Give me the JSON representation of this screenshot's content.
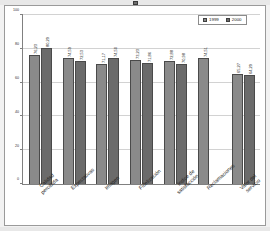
{
  "chart_data": {
    "type": "bar",
    "title": "",
    "subtitle": "",
    "xlabel": "",
    "ylabel": "",
    "ylim": [
      0,
      100
    ],
    "yticks": [
      0,
      20,
      40,
      60,
      80,
      100
    ],
    "ytick_labels": [
      "0",
      "20",
      "40",
      "60",
      "80",
      "100"
    ],
    "grid": true,
    "legend_position": "top-right",
    "categories": [
      "Calidad percibida",
      "Expectativas",
      "Imagen",
      "Fidelización",
      "Índice de satisfacción",
      "Reclamaciones",
      "Valor del servicio"
    ],
    "category_lines": [
      [
        "Calidad",
        "percibida"
      ],
      [
        "Expectativas"
      ],
      [
        "Imagen"
      ],
      [
        "Fidelización"
      ],
      [
        "Índice de",
        "satisfacción"
      ],
      [
        "Reclamaciones"
      ],
      [
        "Valor del",
        "servicio"
      ]
    ],
    "series": [
      {
        "name": "1999",
        "color": "#8a8a8a",
        "values": [
          76.23,
          74.59,
          71.17,
          73.23,
          72.88,
          74.51,
          65.27
        ],
        "labels": [
          "76,23",
          "74,59",
          "71,17",
          "73,23",
          "72,88",
          "74,51",
          "65,27"
        ]
      },
      {
        "name": "2000",
        "color": "#6b6b6b",
        "values": [
          80.29,
          72.53,
          74.5,
          71.86,
          70.98,
          null,
          64.29
        ],
        "labels": [
          "80,29",
          "72,53",
          "74,50",
          "71,86",
          "70,98",
          "",
          "64,29"
        ]
      }
    ]
  },
  "legend": {
    "entries": [
      {
        "label": "1999",
        "swatch": "legend-swatch-1999"
      },
      {
        "label": "2000",
        "swatch": "legend-swatch-2000"
      }
    ]
  },
  "colors": {
    "series_1999": "#8a8a8a",
    "series_2000": "#6b6b6b",
    "gridline": "#d2d2d2",
    "axis": "#808080",
    "plot_background": "#ffffff",
    "frame_border": "#9a9a9a",
    "sheet_background": "#f2f2f2"
  }
}
